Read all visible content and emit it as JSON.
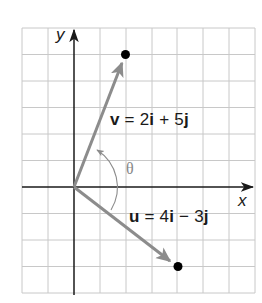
{
  "diagram": {
    "type": "vector-plot",
    "grid": {
      "x_min": -2,
      "x_max": 7,
      "y_min": -4,
      "y_max": 6,
      "cell_px_x": 25.8,
      "cell_px_y": 26.5,
      "origin_px": [
        74,
        187
      ]
    },
    "axes": {
      "x_label": "x",
      "y_label": "y"
    },
    "vectors": [
      {
        "name": "v",
        "components": [
          2,
          5
        ],
        "label_var": "v",
        "label_rest": " = 2",
        "label_i": "i",
        "label_plus": " + 5",
        "label_j": "j"
      },
      {
        "name": "u",
        "components": [
          4,
          -3
        ],
        "label_var": "u",
        "label_rest": " = 4",
        "label_i": "i",
        "label_plus": " − 3",
        "label_j": "j"
      }
    ],
    "angle_label": "θ",
    "colors": {
      "vector": "#8c8c8c",
      "axis": "#1a1a1a",
      "grid": "#c8c8c8",
      "point": "#000000",
      "arc": "#8c8c8c"
    }
  }
}
